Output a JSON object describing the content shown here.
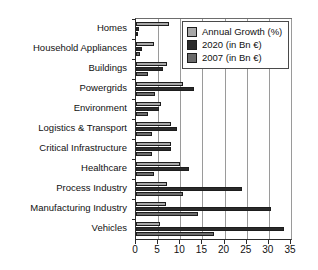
{
  "chart_data": {
    "type": "bar",
    "orientation": "horizontal",
    "title": "",
    "xlabel": "",
    "ylabel": "",
    "xlim": [
      0,
      35
    ],
    "xticks": [
      0,
      5,
      10,
      15,
      20,
      25,
      30,
      35
    ],
    "grid": true,
    "legend_position": "top-right",
    "categories": [
      "Homes",
      "Household Appliances",
      "Buildings",
      "Powergrids",
      "Environment",
      "Logistics & Transport",
      "Critical Infrastructure",
      "Healthcare",
      "Process Industry",
      "Manufacturing Industry",
      "Vehicles"
    ],
    "series": [
      {
        "name": "Annual Growth (%)",
        "color": "#a8a8a8",
        "values": [
          7.5,
          4.0,
          7.0,
          10.5,
          5.6,
          8.0,
          8.0,
          10.0,
          7.0,
          6.7,
          5.5
        ]
      },
      {
        "name": "2020 (in Bn €)",
        "color": "#2a2a2a",
        "values": [
          0.6,
          1.3,
          6.0,
          13.0,
          5.3,
          9.2,
          8.0,
          12.0,
          24.0,
          30.5,
          33.5
        ]
      },
      {
        "name": "2007 (in Bn €)",
        "color": "#6b6b6b",
        "values": [
          0.3,
          0.8,
          2.7,
          4.3,
          2.8,
          3.7,
          3.5,
          4.0,
          10.5,
          14.0,
          17.5
        ]
      }
    ]
  }
}
